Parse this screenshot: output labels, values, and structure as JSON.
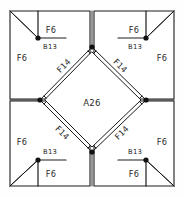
{
  "diagram": {
    "type": "quilt-block-piecing-diagram",
    "canvas": {
      "width": 184,
      "height": 197
    },
    "colors": {
      "line": "#1c1c1c",
      "fill": "#ffffff",
      "background": "#fefefe",
      "label": "#2b2b2b",
      "node": "#111111"
    },
    "geometry": {
      "outer": {
        "left": 10,
        "top": 11,
        "right": 174,
        "bottom": 186
      },
      "center": {
        "x": 92,
        "y": 99
      },
      "diamond_points": {
        "top": {
          "x": 92,
          "y": 47
        },
        "right": {
          "x": 146,
          "y": 100
        },
        "bottom": {
          "x": 92,
          "y": 152
        },
        "left": {
          "x": 40,
          "y": 100
        }
      },
      "inner_square_points": {
        "top": {
          "x": 92,
          "y": 52
        },
        "right": {
          "x": 141,
          "y": 100
        },
        "bottom": {
          "x": 92,
          "y": 148
        },
        "left": {
          "x": 45,
          "y": 100
        }
      },
      "seam_offset": 3.0,
      "node_radius": 2.6
    },
    "patches": [
      {
        "id": "center-square",
        "code": "A26",
        "quadrant": "center",
        "label_x": 92,
        "label_y": 103,
        "size": "center"
      },
      {
        "id": "f14-top-left",
        "code": "F14",
        "quadrant": "top-left",
        "label_x": 64,
        "label_y": 66,
        "rotation": -45,
        "size": "normal"
      },
      {
        "id": "f14-top-right",
        "code": "F14",
        "quadrant": "top-right",
        "label_x": 120,
        "label_y": 66,
        "rotation": 45,
        "size": "normal"
      },
      {
        "id": "f14-bottom-left",
        "code": "F14",
        "quadrant": "bottom-left",
        "label_x": 62,
        "label_y": 133,
        "rotation": 45,
        "size": "normal"
      },
      {
        "id": "f14-bottom-right",
        "code": "F14",
        "quadrant": "bottom-right",
        "label_x": 122,
        "label_y": 133,
        "rotation": -45,
        "size": "normal"
      },
      {
        "id": "b13-top-left",
        "code": "B13",
        "quadrant": "top-left",
        "label_x": 49,
        "label_y": 46,
        "size": "small"
      },
      {
        "id": "b13-top-right",
        "code": "B13",
        "quadrant": "top-right",
        "label_x": 136,
        "label_y": 46,
        "size": "small"
      },
      {
        "id": "b13-bottom-left",
        "code": "B13",
        "quadrant": "bottom-left",
        "label_x": 46,
        "label_y": 155,
        "size": "small"
      },
      {
        "id": "b13-bottom-right",
        "code": "B13",
        "quadrant": "bottom-right",
        "label_x": 137,
        "label_y": 155,
        "size": "small"
      },
      {
        "id": "f6-top-left-upper",
        "code": "F6",
        "quadrant": "top-left",
        "label_x": 51,
        "label_y": 30,
        "size": "normal"
      },
      {
        "id": "f6-top-left-left",
        "code": "F6",
        "quadrant": "top-left",
        "label_x": 22,
        "label_y": 58,
        "size": "normal"
      },
      {
        "id": "f6-top-right-upper",
        "code": "F6",
        "quadrant": "top-right",
        "label_x": 134,
        "label_y": 30,
        "size": "normal"
      },
      {
        "id": "f6-top-right-right",
        "code": "F6",
        "quadrant": "top-right",
        "label_x": 162,
        "label_y": 58,
        "size": "normal"
      },
      {
        "id": "f6-bottom-left-left",
        "code": "F6",
        "quadrant": "bottom-left",
        "label_x": 22,
        "label_y": 146,
        "size": "normal"
      },
      {
        "id": "f6-bottom-left-lower",
        "code": "F6",
        "quadrant": "bottom-left",
        "label_x": 51,
        "label_y": 176,
        "size": "normal"
      },
      {
        "id": "f6-bottom-right-right",
        "code": "F6",
        "quadrant": "bottom-right",
        "label_x": 162,
        "label_y": 146,
        "size": "normal"
      },
      {
        "id": "f6-bottom-right-lower",
        "code": "F6",
        "quadrant": "bottom-right",
        "label_x": 134,
        "label_y": 176,
        "size": "normal"
      }
    ],
    "legend": {
      "center_code": "A26",
      "strip_code": "F14",
      "small_triangle_code": "B13",
      "corner_triangle_code": "F6"
    }
  }
}
